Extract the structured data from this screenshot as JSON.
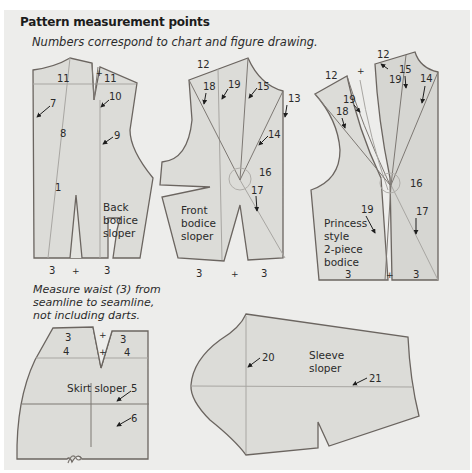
{
  "header": {
    "title": "Pattern measurement points",
    "subtitle": "Numbers correspond to chart and figure drawing."
  },
  "note": {
    "line1": "Measure waist (3) from",
    "line2": "seamline to seamline,",
    "line3": "not including darts."
  },
  "pieces": {
    "back_bodice": {
      "label_lines": [
        "Back",
        "bodice",
        "sloper"
      ],
      "points": {
        "p11a": "11",
        "p11b": "11",
        "p7": "7",
        "p10": "10",
        "p8": "8",
        "p9": "9",
        "p1": "1",
        "p3a": "3",
        "p3b": "3"
      }
    },
    "front_bodice": {
      "label_lines": [
        "Front",
        "bodice",
        "sloper"
      ],
      "points": {
        "p12": "12",
        "p18": "18",
        "p19": "19",
        "p15": "15",
        "p13": "13",
        "p14": "14",
        "p16": "16",
        "p17": "17",
        "p3a": "3",
        "p3b": "3"
      }
    },
    "princess_bodice": {
      "label_lines": [
        "Princess",
        "style",
        "2-piece",
        "bodice"
      ],
      "points": {
        "p12a": "12",
        "p12b": "12",
        "p15": "15",
        "p19a": "19",
        "p14": "14",
        "p19b": "19",
        "p18": "18",
        "p16": "16",
        "p19c": "19",
        "p17": "17",
        "p3a": "3",
        "p3b": "3"
      }
    },
    "skirt": {
      "label": "Skirt sloper",
      "points": {
        "p3a": "3",
        "p3b": "3",
        "p4a": "4",
        "p4b": "4",
        "p5": "5",
        "p6": "6"
      }
    },
    "sleeve": {
      "label_lines": [
        "Sleeve",
        "sloper"
      ],
      "points": {
        "p20": "20",
        "p21": "21"
      }
    }
  },
  "markers": {
    "plus": "+"
  },
  "colors": {
    "background": "#ededeb",
    "piece_fill": "#dcdcd8",
    "outline": "#6b6560",
    "guide": "#a8a6a2",
    "text": "#2a2a2a"
  }
}
